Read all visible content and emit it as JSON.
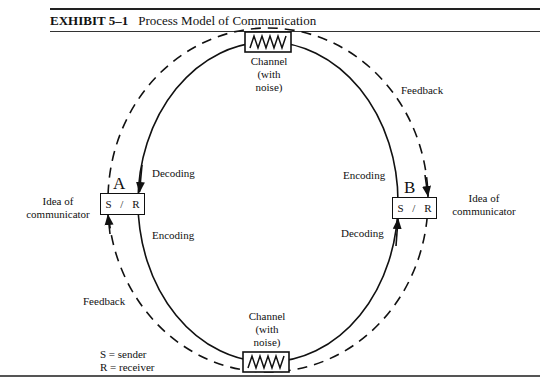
{
  "header": {
    "exhibit_number": "EXHIBIT 5–1",
    "title": "Process Model of Communication"
  },
  "nodes": {
    "a": {
      "letter": "A",
      "sender": "S",
      "separator": "/",
      "receiver": "R",
      "idea_label_1": "Idea of",
      "idea_label_2": "communicator"
    },
    "b": {
      "letter": "B",
      "sender": "S",
      "separator": "/",
      "receiver": "R",
      "idea_label_1": "Idea of",
      "idea_label_2": "communicator"
    }
  },
  "channels": {
    "top": {
      "line1": "Channel",
      "line2": "(with",
      "line3": "noise)",
      "icon": "noise-zigzag-icon"
    },
    "bottom": {
      "line1": "Channel",
      "line2": "(with",
      "line3": "noise)",
      "icon": "noise-zigzag-icon"
    }
  },
  "labels": {
    "a_decoding": "Decoding",
    "a_encoding": "Encoding",
    "b_encoding": "Encoding",
    "b_decoding": "Decoding",
    "feedback_top": "Feedback",
    "feedback_bottom": "Feedback"
  },
  "legend": {
    "s_def": "S = sender",
    "r_def": "R = receiver"
  }
}
